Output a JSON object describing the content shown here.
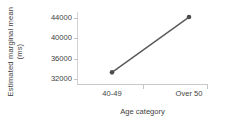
{
  "chart_data": {
    "type": "line",
    "title": "",
    "subtitle": "",
    "xlabel": "Age category",
    "ylabel": "Estimated marginal mean",
    "ylabel_unit": "(ms)",
    "categories": [
      "40-49",
      "Over 50"
    ],
    "series": [
      {
        "name": "Estimated marginal mean",
        "values": [
          33300,
          44200
        ]
      }
    ],
    "yticks": [
      32000,
      36000,
      40000,
      44000
    ],
    "ytick_labels": [
      "32000",
      "36000",
      "40000",
      "44000"
    ],
    "ylim": [
      31000,
      45200
    ],
    "grid": false,
    "legend": false,
    "legend_position": "none",
    "marker": "filled-circle",
    "line_color": "#595959",
    "marker_color": "#4d4d4d",
    "axis_color": "#c9c9c9",
    "text_color": "#3f3f3f",
    "background": "#ffffff",
    "annotations": []
  }
}
